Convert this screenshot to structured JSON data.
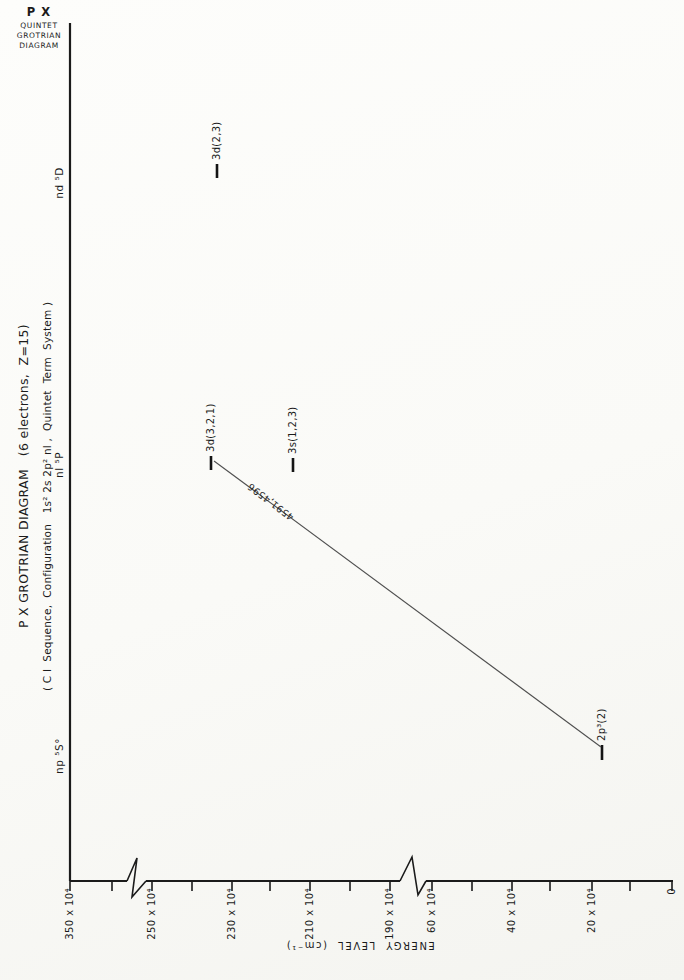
{
  "page_header": {
    "line1": "P X",
    "line2": "QUINTET",
    "line3": "GROTRIAN",
    "line4": "DIAGRAM"
  },
  "figure": {
    "title_line1": "P X GROTRIAN DIAGRAM   (6 electrons,  Z=15)",
    "title_line2": "( C I  Sequence,  Configuration   1s² 2s 2p² nl ,  Quintet  Term  System )",
    "columns": [
      {
        "label": "np ⁵S°"
      },
      {
        "label": "nl ⁵P"
      },
      {
        "label": "nd ⁵D"
      }
    ],
    "axis": {
      "title": "ENERGY  LEVEL  (cm⁻¹)",
      "tick_labels": [
        "350 x 10⁴",
        "250 x 10⁴",
        "230 x 10⁴",
        "210 x 10⁴",
        "190 x 10⁴",
        "60 x 10⁴",
        "40 x 10⁴",
        "20 x 10⁴",
        "0"
      ]
    },
    "levels": [
      {
        "label": "3d(2,3)",
        "column": "nd ⁵D",
        "energy_1e4_cm": 234
      },
      {
        "label": "3d(3,2,1)",
        "column": "nl ⁵P",
        "energy_1e4_cm": 235
      },
      {
        "label": "3s(1,2,3)",
        "column": "nl ⁵P",
        "energy_1e4_cm": 214
      },
      {
        "label": "2p³(2)",
        "column": "np ⁵S°",
        "energy_1e4_cm": 17.5
      }
    ],
    "transition": {
      "label": "4591,4596",
      "from": "2p³(2)",
      "to": "3d(3,2,1)"
    }
  },
  "chart_data": {
    "type": "scatter",
    "title": "P X GROTRIAN DIAGRAM (6 electrons, Z=15)",
    "subtitle": "(C I Sequence, Configuration 1s² 2s 2p² nl , Quintet Term System)",
    "categories": [
      "np ⁵S°",
      "nl ⁵P",
      "nd ⁵D"
    ],
    "ylabel": "ENERGY LEVEL (cm⁻¹)",
    "ylim": [
      0,
      3500000
    ],
    "y_axis_breaks": [
      [
        600000,
        1900000
      ],
      [
        2500000,
        3500000
      ]
    ],
    "y_tick_labels": [
      "350 x 10⁴",
      "250 x 10⁴",
      "230 x 10⁴",
      "210 x 10⁴",
      "190 x 10⁴",
      "60 x 10⁴",
      "40 x 10⁴",
      "20 x 10⁴",
      "0"
    ],
    "points": [
      {
        "category": "np ⁵S°",
        "label": "2p³(2)",
        "energy_cm": 175000
      },
      {
        "category": "nl ⁵P",
        "label": "3s(1,2,3)",
        "energy_cm": 2142000
      },
      {
        "category": "nl ⁵P",
        "label": "3d(3,2,1)",
        "energy_cm": 2352000
      },
      {
        "category": "nd ⁵D",
        "label": "3d(2,3)",
        "energy_cm": 2338000
      }
    ],
    "transitions": [
      {
        "from": "2p³(2)",
        "to": "3d(3,2,1)",
        "wavelengths_angstrom": "4591,4596"
      }
    ],
    "legend": null,
    "grid": false
  }
}
